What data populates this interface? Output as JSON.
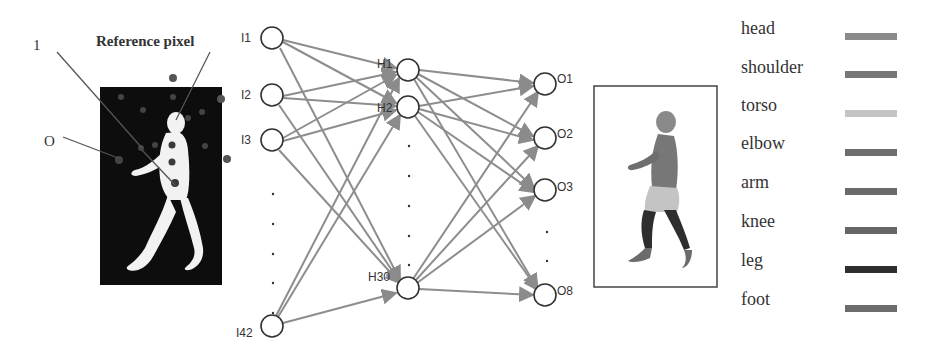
{
  "figure": {
    "left_panel": {
      "annotations": {
        "one_label": "1",
        "o_label": "O",
        "reference_label": "Reference pixel"
      }
    },
    "network": {
      "input_nodes": [
        {
          "label": "I1",
          "x": 272,
          "y": 38
        },
        {
          "label": "I2",
          "x": 272,
          "y": 95
        },
        {
          "label": "I3",
          "x": 272,
          "y": 140
        },
        {
          "label": "I42",
          "x": 272,
          "y": 326
        }
      ],
      "hidden_nodes": [
        {
          "label": "H1",
          "x": 408,
          "y": 70
        },
        {
          "label": "H2",
          "x": 408,
          "y": 107
        },
        {
          "label": "H30",
          "x": 408,
          "y": 288
        }
      ],
      "output_nodes": [
        {
          "label": "O1",
          "x": 545,
          "y": 84
        },
        {
          "label": "O2",
          "x": 545,
          "y": 138
        },
        {
          "label": "O3",
          "x": 545,
          "y": 190
        },
        {
          "label": "O8",
          "x": 545,
          "y": 295
        }
      ],
      "ellipsis": "·"
    },
    "legend": {
      "items": [
        {
          "label": "head",
          "color": "#8a8a8a"
        },
        {
          "label": "shoulder",
          "color": "#777777"
        },
        {
          "label": "torso",
          "color": "#c4c4c4"
        },
        {
          "label": "elbow",
          "color": "#6e6e6e"
        },
        {
          "label": "arm",
          "color": "#6a6a6a"
        },
        {
          "label": "knee",
          "color": "#666666"
        },
        {
          "label": "leg",
          "color": "#2e2e2e"
        },
        {
          "label": "foot",
          "color": "#6c6c6c"
        }
      ]
    }
  }
}
